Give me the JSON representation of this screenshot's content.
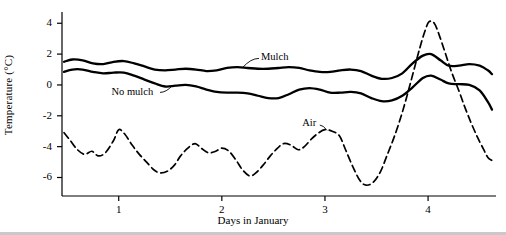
{
  "chart_data": {
    "type": "line",
    "title": "",
    "xlabel": "Days in January",
    "ylabel": "Temperature (°C)",
    "xlim": [
      0.45,
      4.62
    ],
    "ylim": [
      -7.2,
      4.6
    ],
    "yticks": [
      4,
      2,
      0,
      -2,
      -4,
      -6
    ],
    "xticks": [
      1,
      2,
      3,
      4
    ],
    "grid": false,
    "legend": "inline-annotations",
    "series": [
      {
        "name": "Mulch",
        "style": "solid",
        "label_x": 2.38,
        "label_y": 1.75,
        "points": [
          [
            0.47,
            1.5
          ],
          [
            0.55,
            1.65
          ],
          [
            0.65,
            1.6
          ],
          [
            0.75,
            1.4
          ],
          [
            0.85,
            1.35
          ],
          [
            0.95,
            1.5
          ],
          [
            1.05,
            1.55
          ],
          [
            1.15,
            1.4
          ],
          [
            1.25,
            1.2
          ],
          [
            1.35,
            1.0
          ],
          [
            1.45,
            0.95
          ],
          [
            1.55,
            1.0
          ],
          [
            1.65,
            1.05
          ],
          [
            1.75,
            1.0
          ],
          [
            1.85,
            0.9
          ],
          [
            1.95,
            0.95
          ],
          [
            2.05,
            1.1
          ],
          [
            2.15,
            1.15
          ],
          [
            2.25,
            1.1
          ],
          [
            2.35,
            1.05
          ],
          [
            2.45,
            1.05
          ],
          [
            2.55,
            1.1
          ],
          [
            2.65,
            1.15
          ],
          [
            2.75,
            1.1
          ],
          [
            2.85,
            0.95
          ],
          [
            2.95,
            0.85
          ],
          [
            3.05,
            0.85
          ],
          [
            3.15,
            0.95
          ],
          [
            3.25,
            1.0
          ],
          [
            3.35,
            0.9
          ],
          [
            3.45,
            0.6
          ],
          [
            3.55,
            0.4
          ],
          [
            3.65,
            0.45
          ],
          [
            3.75,
            0.75
          ],
          [
            3.85,
            1.4
          ],
          [
            3.95,
            1.9
          ],
          [
            4.03,
            2.0
          ],
          [
            4.12,
            1.6
          ],
          [
            4.2,
            1.25
          ],
          [
            4.3,
            1.25
          ],
          [
            4.4,
            1.35
          ],
          [
            4.5,
            1.25
          ],
          [
            4.58,
            0.95
          ],
          [
            4.62,
            0.7
          ]
        ]
      },
      {
        "name": "No mulch",
        "style": "solid",
        "label_x": 0.93,
        "label_y": -0.55,
        "points": [
          [
            0.47,
            0.85
          ],
          [
            0.55,
            1.0
          ],
          [
            0.65,
            1.0
          ],
          [
            0.75,
            0.85
          ],
          [
            0.85,
            0.75
          ],
          [
            0.95,
            0.8
          ],
          [
            1.05,
            0.8
          ],
          [
            1.15,
            0.6
          ],
          [
            1.25,
            0.35
          ],
          [
            1.35,
            0.1
          ],
          [
            1.45,
            -0.1
          ],
          [
            1.55,
            -0.05
          ],
          [
            1.65,
            0.0
          ],
          [
            1.75,
            -0.1
          ],
          [
            1.85,
            -0.3
          ],
          [
            1.95,
            -0.45
          ],
          [
            2.05,
            -0.5
          ],
          [
            2.15,
            -0.5
          ],
          [
            2.25,
            -0.55
          ],
          [
            2.35,
            -0.7
          ],
          [
            2.45,
            -0.85
          ],
          [
            2.55,
            -0.85
          ],
          [
            2.65,
            -0.6
          ],
          [
            2.75,
            -0.3
          ],
          [
            2.85,
            -0.2
          ],
          [
            2.95,
            -0.3
          ],
          [
            3.05,
            -0.5
          ],
          [
            3.15,
            -0.5
          ],
          [
            3.25,
            -0.45
          ],
          [
            3.35,
            -0.55
          ],
          [
            3.45,
            -0.85
          ],
          [
            3.55,
            -1.05
          ],
          [
            3.65,
            -1.0
          ],
          [
            3.75,
            -0.7
          ],
          [
            3.85,
            -0.15
          ],
          [
            3.95,
            0.45
          ],
          [
            4.03,
            0.6
          ],
          [
            4.12,
            0.35
          ],
          [
            4.2,
            0.1
          ],
          [
            4.3,
            0.05
          ],
          [
            4.4,
            0.0
          ],
          [
            4.5,
            -0.35
          ],
          [
            4.58,
            -1.1
          ],
          [
            4.62,
            -1.6
          ]
        ]
      },
      {
        "name": "Air",
        "style": "dashed",
        "label_x": 2.78,
        "label_y": -2.55,
        "points": [
          [
            0.47,
            -3.1
          ],
          [
            0.53,
            -3.6
          ],
          [
            0.6,
            -4.2
          ],
          [
            0.67,
            -4.5
          ],
          [
            0.74,
            -4.3
          ],
          [
            0.8,
            -4.6
          ],
          [
            0.87,
            -4.4
          ],
          [
            0.95,
            -3.6
          ],
          [
            1.0,
            -2.9
          ],
          [
            1.06,
            -3.2
          ],
          [
            1.13,
            -3.9
          ],
          [
            1.2,
            -4.5
          ],
          [
            1.27,
            -5.0
          ],
          [
            1.34,
            -5.5
          ],
          [
            1.4,
            -5.7
          ],
          [
            1.47,
            -5.6
          ],
          [
            1.54,
            -5.2
          ],
          [
            1.6,
            -4.6
          ],
          [
            1.67,
            -4.1
          ],
          [
            1.74,
            -3.8
          ],
          [
            1.8,
            -4.1
          ],
          [
            1.87,
            -4.4
          ],
          [
            1.94,
            -4.3
          ],
          [
            2.0,
            -4.1
          ],
          [
            2.07,
            -4.3
          ],
          [
            2.14,
            -4.9
          ],
          [
            2.2,
            -5.5
          ],
          [
            2.27,
            -5.9
          ],
          [
            2.33,
            -5.7
          ],
          [
            2.4,
            -5.2
          ],
          [
            2.47,
            -4.6
          ],
          [
            2.54,
            -4.1
          ],
          [
            2.6,
            -3.8
          ],
          [
            2.67,
            -3.9
          ],
          [
            2.74,
            -4.2
          ],
          [
            2.8,
            -4.0
          ],
          [
            2.87,
            -3.5
          ],
          [
            2.94,
            -3.1
          ],
          [
            3.0,
            -2.9
          ],
          [
            3.07,
            -3.0
          ],
          [
            3.14,
            -3.3
          ],
          [
            3.2,
            -4.2
          ],
          [
            3.27,
            -5.3
          ],
          [
            3.34,
            -6.2
          ],
          [
            3.4,
            -6.5
          ],
          [
            3.47,
            -6.3
          ],
          [
            3.54,
            -5.6
          ],
          [
            3.6,
            -4.6
          ],
          [
            3.67,
            -3.4
          ],
          [
            3.74,
            -2.0
          ],
          [
            3.8,
            -0.6
          ],
          [
            3.86,
            0.9
          ],
          [
            3.92,
            2.4
          ],
          [
            3.97,
            3.5
          ],
          [
            4.01,
            4.1
          ],
          [
            4.06,
            4.0
          ],
          [
            4.11,
            3.2
          ],
          [
            4.17,
            2.0
          ],
          [
            4.23,
            0.8
          ],
          [
            4.3,
            -0.4
          ],
          [
            4.36,
            -1.5
          ],
          [
            4.42,
            -2.5
          ],
          [
            4.48,
            -3.4
          ],
          [
            4.54,
            -4.2
          ],
          [
            4.58,
            -4.7
          ],
          [
            4.62,
            -4.9
          ]
        ]
      }
    ]
  }
}
